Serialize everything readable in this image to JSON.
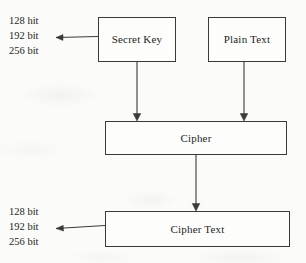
{
  "diagram": {
    "background_color": "#fbfbf9",
    "stroke_color": "#3a3a38",
    "text_color": "#231f1e",
    "nodes": [
      {
        "id": "secret-key",
        "label": "Secret Key",
        "shape": "rectangle"
      },
      {
        "id": "plain-text",
        "label": "Plain Text",
        "shape": "rectangle"
      },
      {
        "id": "cipher",
        "label": "Cipher",
        "shape": "rectangle"
      },
      {
        "id": "cipher-text",
        "label": "Cipher Text",
        "shape": "rectangle"
      }
    ],
    "key_size_labels": {
      "name": "key-size-annotation",
      "lines": [
        "128 hit",
        "192 bit",
        "256 bit"
      ]
    },
    "output_size_labels": {
      "name": "output-size-annotation",
      "lines": [
        "128 bit",
        "192 bit",
        "256 bit"
      ]
    },
    "edges": [
      {
        "id": "secret-key-to-sizes",
        "from": "secret-key",
        "to": "key-size-annotation",
        "direction": "left"
      },
      {
        "id": "secret-key-to-cipher",
        "from": "secret-key",
        "to": "cipher",
        "direction": "down"
      },
      {
        "id": "plain-text-to-cipher",
        "from": "plain-text",
        "to": "cipher",
        "direction": "down"
      },
      {
        "id": "cipher-to-cipher-text",
        "from": "cipher",
        "to": "cipher-text",
        "direction": "down"
      },
      {
        "id": "cipher-text-to-sizes",
        "from": "cipher-text",
        "to": "output-size-annotation",
        "direction": "left"
      }
    ]
  }
}
